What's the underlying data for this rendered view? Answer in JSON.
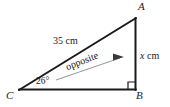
{
  "figure": {
    "type": "right-triangle-trigonometry-diagram",
    "vertices": {
      "A": "A",
      "B": "B",
      "C": "C"
    },
    "labels": {
      "hypotenuse": "35 cm",
      "opposite": "opposite",
      "unknown_side": "x cm",
      "unknown_side_variable": "x",
      "unknown_side_unit": "cm",
      "angle": "26°",
      "angle_value": "26",
      "angle_unit": "°"
    },
    "markers": {
      "right_angle": "right-angle-square",
      "pointer": "arrow-to-opposite-side"
    },
    "colors": {
      "stroke": "#1a1a1a",
      "thin_stroke": "#6e6e6e",
      "background": "#ffffff",
      "text": "#1a1a1a"
    },
    "geometry": {
      "A": [
        136,
        18
      ],
      "B": [
        135,
        90
      ],
      "C": [
        19,
        90
      ],
      "right_angle_size": 7,
      "pointer_start": [
        56,
        80
      ],
      "pointer_end": [
        124,
        57
      ]
    }
  }
}
